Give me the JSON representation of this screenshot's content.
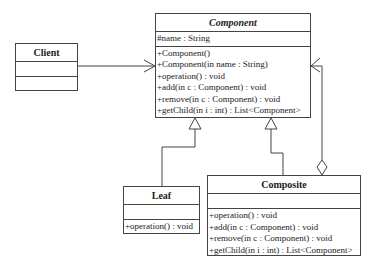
{
  "classes": {
    "component": {
      "name": "Component",
      "attributes": [
        "#name : String"
      ],
      "operations": [
        "+Component()",
        "+Component(in name : String)",
        "+operation() : void",
        "+add(in c : Component) : void",
        "+remove(in c : Component) : void",
        "+getChild(in i : int) : List<Component>"
      ]
    },
    "client": {
      "name": "Client",
      "attributes": [],
      "operations": []
    },
    "leaf": {
      "name": "Leaf",
      "attributes": [],
      "operations": [
        "+operation() : void"
      ]
    },
    "composite": {
      "name": "Composite",
      "attributes": [],
      "operations": [
        "+operation() : void",
        "+add(in c : Component) : void",
        "+remove(in c : Component) : void",
        "+getChild(in i : int) : List<Component>"
      ]
    }
  },
  "relationships": [
    {
      "type": "association",
      "from": "Client",
      "to": "Component"
    },
    {
      "type": "generalization",
      "from": "Leaf",
      "to": "Component"
    },
    {
      "type": "generalization",
      "from": "Composite",
      "to": "Component"
    },
    {
      "type": "aggregation",
      "from": "Composite",
      "to": "Component"
    }
  ]
}
